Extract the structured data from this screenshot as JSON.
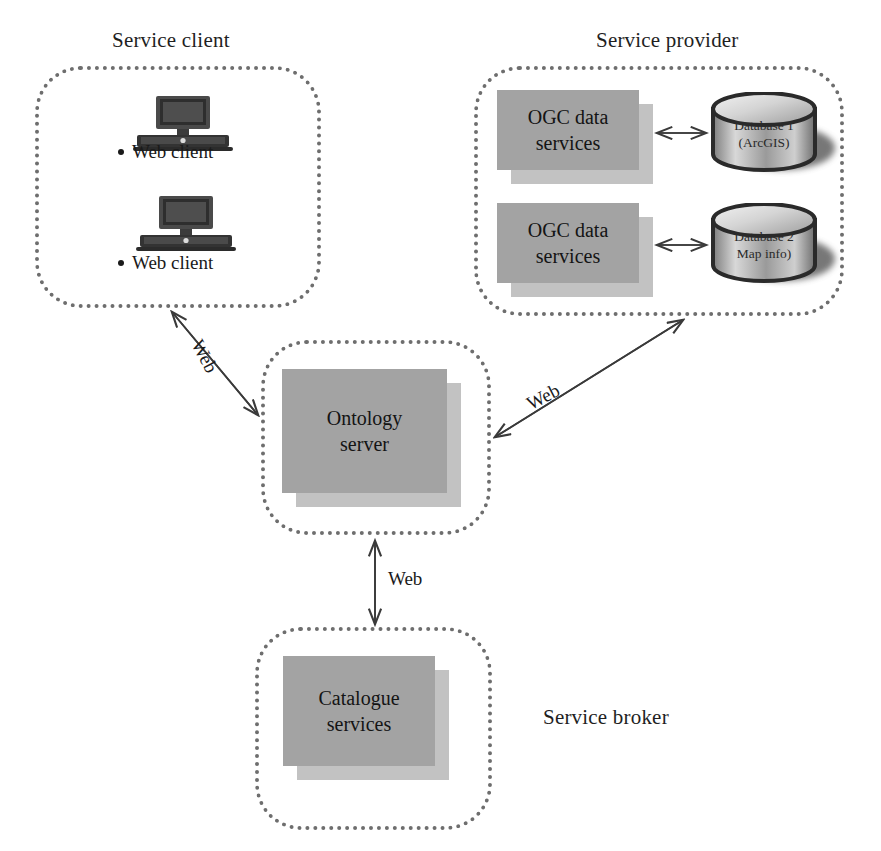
{
  "diagram": {
    "groups": [
      {
        "key": "service_client",
        "caption": "Service client"
      },
      {
        "key": "service_provider",
        "caption": "Service provider"
      },
      {
        "key": "ontology",
        "caption": ""
      },
      {
        "key": "service_broker",
        "caption": "Service broker"
      }
    ],
    "service_client": {
      "caption": "Service client",
      "clients": [
        {
          "icon": "desktop-computer-icon",
          "label": "Web client"
        },
        {
          "icon": "desktop-computer-icon",
          "label": "Web client"
        }
      ]
    },
    "service_provider": {
      "caption": "Service provider",
      "rows": [
        {
          "service": {
            "line1": "OGC data",
            "line2": "services"
          },
          "database": {
            "line1": "Database 1",
            "line2": "(ArcGIS)"
          },
          "connector": "double-arrow"
        },
        {
          "service": {
            "line1": "OGC data",
            "line2": "services"
          },
          "database": {
            "line1": "Database 2",
            "line2": "Map info)"
          },
          "connector": "double-arrow"
        }
      ]
    },
    "ontology": {
      "server": {
        "line1": "Ontology",
        "line2": "server"
      }
    },
    "service_broker": {
      "caption": "Service broker",
      "catalogue": {
        "line1": "Catalogue",
        "line2": "services"
      }
    },
    "edges": [
      {
        "key": "client_ontology",
        "label": "Web",
        "from": "service-client-group",
        "to": "ontology-group",
        "style": "double-arrow"
      },
      {
        "key": "provider_ontology",
        "label": "Web",
        "from": "ontology-group",
        "to": "service-provider-group",
        "style": "double-arrow"
      },
      {
        "key": "ontology_broker",
        "label": "Web",
        "from": "ontology-group",
        "to": "service-broker-group",
        "style": "double-arrow"
      }
    ],
    "colors": {
      "box_front": "#a3a3a3",
      "box_back": "#c2c2c2",
      "dotted_border": "#6e6e6e",
      "arrow": "#3a3a3a",
      "text": "#1a1a1a",
      "background": "#ffffff"
    }
  }
}
